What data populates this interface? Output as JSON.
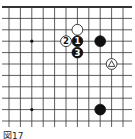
{
  "diagram": {
    "type": "go-board-fragment",
    "caption": "図17",
    "grid": {
      "x0": 9,
      "y0": 7,
      "spacing": 11.4,
      "cols": 12,
      "rows": 11,
      "top_edge": true,
      "left_edge": false,
      "right_edge": false,
      "bottom_edge": false,
      "line_color": "#333333"
    },
    "hoshi": [
      {
        "col": 2,
        "row": 3
      },
      {
        "col": 2,
        "row": 9
      }
    ],
    "stones": [
      {
        "color": "white",
        "col": 6,
        "row": 2,
        "label": ""
      },
      {
        "color": "white",
        "col": 5,
        "row": 3,
        "label": "2"
      },
      {
        "color": "black",
        "col": 6,
        "row": 3,
        "label": "1"
      },
      {
        "color": "black",
        "col": 6,
        "row": 4,
        "label": "3"
      },
      {
        "color": "black",
        "col": 8,
        "row": 3,
        "label": ""
      },
      {
        "color": "white",
        "col": 9,
        "row": 5,
        "label": "",
        "marker": "triangle"
      },
      {
        "color": "black",
        "col": 8,
        "row": 9,
        "label": ""
      }
    ]
  }
}
